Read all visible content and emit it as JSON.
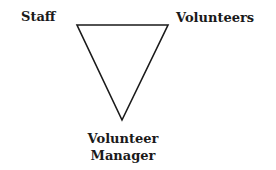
{
  "diagram": {
    "type": "inverted-triangle",
    "nodes": {
      "top_left": "Staff",
      "top_right": "Volunteers",
      "bottom_line1": "Volunteer",
      "bottom_line2": "Manager"
    },
    "stroke_color": "#1a1a1a",
    "background": "#ffffff"
  }
}
